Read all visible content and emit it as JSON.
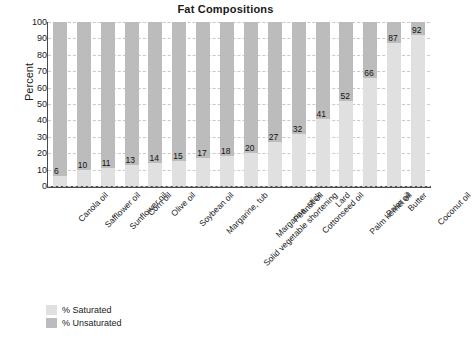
{
  "chart_data": {
    "type": "bar",
    "title": "Fat Compositions",
    "xlabel": "",
    "ylabel": "Percent",
    "ylim": [
      0,
      100
    ],
    "ytick_step": 10,
    "yticks": [
      0,
      10,
      20,
      30,
      40,
      50,
      60,
      70,
      80,
      90,
      100
    ],
    "grid": true,
    "stacked": true,
    "legend_position": "bottom-left",
    "categories": [
      "Canola oil",
      "Safflower oil",
      "Sunflower oil",
      "Corn oil",
      "Olive oil",
      "Soybean oil",
      "Margarine, tub",
      "Solid vegetable shortening",
      "Margarine, stick",
      "Peanut oil",
      "Cottonseed oil",
      "Lard",
      "Palm kernel oil",
      "Palm oil",
      "Butter",
      "Coconut oil"
    ],
    "series": [
      {
        "name": "% Saturated",
        "color": "#e0e0e0",
        "values": [
          6,
          10,
          11,
          13,
          14,
          15,
          17,
          18,
          20,
          27,
          32,
          41,
          52,
          66,
          87,
          92
        ]
      },
      {
        "name": "% Unsaturated",
        "color": "#bcbcbc",
        "values": [
          94,
          90,
          89,
          87,
          86,
          85,
          83,
          82,
          80,
          73,
          68,
          59,
          48,
          34,
          13,
          8
        ]
      }
    ],
    "data_labels": [
      6,
      10,
      11,
      13,
      14,
      15,
      17,
      18,
      20,
      27,
      32,
      41,
      52,
      66,
      87,
      92
    ]
  },
  "legend": {
    "items": [
      {
        "label": "% Saturated",
        "color": "#e0e0e0"
      },
      {
        "label": "% Unsaturated",
        "color": "#bcbcbc"
      }
    ]
  },
  "colors": {
    "saturated": "#e0e0e0",
    "unsaturated": "#bcbcbc",
    "axis": "#4a4a4a",
    "grid": "#c9c9c9",
    "text": "#1a1a1a",
    "background": "#ffffff"
  }
}
